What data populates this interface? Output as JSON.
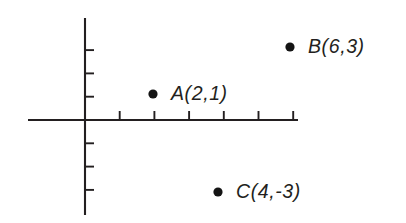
{
  "figure": {
    "background_color": "#ffffff",
    "ink_color": "#231f20",
    "dot_color": "#141414"
  },
  "chart_data": {
    "type": "scatter",
    "title": "",
    "xlabel": "",
    "ylabel": "",
    "grid": false,
    "legend": null,
    "axes": {
      "origin_px": [
        85,
        120
      ],
      "x_unit_px": 34.7,
      "y_unit_px": 23.3,
      "x_axis_px": {
        "y": 120,
        "x_start": 28,
        "x_end": 298
      },
      "y_axis_px": {
        "x": 85,
        "y_start": 18,
        "y_end": 215
      },
      "xlim": [
        -1.7,
        6.2
      ],
      "ylim": [
        -4.1,
        4.4
      ],
      "x_ticks": [
        1,
        2,
        3,
        4,
        5,
        6
      ],
      "y_ticks": [
        1,
        2,
        3,
        -1,
        -2,
        -3
      ],
      "x_tick_labels": [],
      "y_tick_labels": [],
      "tick_length_px": 9
    },
    "points": [
      {
        "name": "A",
        "x": 2,
        "y": 1,
        "label": "A(2,1)",
        "dot_px": [
          153,
          94
        ],
        "label_px": [
          171,
          84
        ]
      },
      {
        "name": "B",
        "x": 6,
        "y": 3,
        "label": "B(6,3)",
        "dot_px": [
          290,
          47
        ],
        "label_px": [
          308,
          37
        ]
      },
      {
        "name": "C",
        "x": 4,
        "y": -3,
        "label": "C(4,-3)",
        "dot_px": [
          218,
          192
        ],
        "label_px": [
          236,
          182
        ]
      }
    ],
    "dot_radius_px": 4.6
  }
}
